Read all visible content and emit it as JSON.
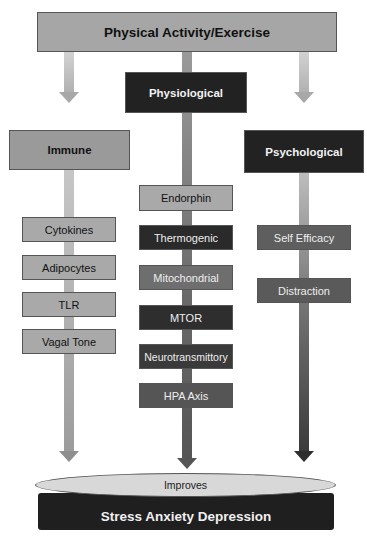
{
  "diagram": {
    "top": {
      "label": "Physical Activity/Exercise"
    },
    "categories": {
      "physiological": {
        "label": "Physiological"
      },
      "immune": {
        "label": "Immune"
      },
      "psychological": {
        "label": "Psychological"
      }
    },
    "immune_items": [
      "Cytokines",
      "Adipocytes",
      "TLR",
      "Vagal Tone"
    ],
    "physiological_items": [
      "Endorphin",
      "Thermogenic",
      "Mitochondrial",
      "MTOR",
      "Neurotransmittory",
      "HPA Axis"
    ],
    "psychological_items": [
      "Self Efficacy",
      "Distraction"
    ],
    "outcome": {
      "connector": "Improves",
      "label": "Stress Anxiety Depression"
    },
    "colors": {
      "light_box": "#a9a9a9",
      "mid_box": "#6e6e6e",
      "dark_box": "#2e2e2e",
      "outcome_bar": "#1f1f1f",
      "ellipse": "#d8d8d8"
    }
  }
}
